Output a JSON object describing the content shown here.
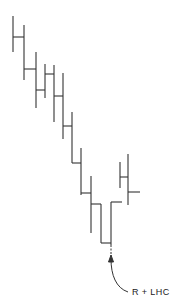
{
  "diagram": {
    "type": "cladogram-step-diagram",
    "stroke_color": "#333333",
    "background": "#ffffff",
    "annotation": {
      "label": "R + LHC",
      "arrow_tip": [
        111,
        256
      ],
      "curve_start": [
        128,
        292
      ]
    },
    "verticals": [
      {
        "x": 13,
        "y1": 16,
        "y2": 52
      },
      {
        "x": 24,
        "y1": 25,
        "y2": 80
      },
      {
        "x": 36,
        "y1": 52,
        "y2": 108
      },
      {
        "x": 45,
        "y1": 64,
        "y2": 98
      },
      {
        "x": 54,
        "y1": 65,
        "y2": 122
      },
      {
        "x": 63,
        "y1": 73,
        "y2": 139
      },
      {
        "x": 72,
        "y1": 112,
        "y2": 163
      },
      {
        "x": 81,
        "y1": 148,
        "y2": 195
      },
      {
        "x": 91,
        "y1": 176,
        "y2": 233
      },
      {
        "x": 101,
        "y1": 204,
        "y2": 243
      },
      {
        "x": 111,
        "y1": 202,
        "y2": 245
      },
      {
        "x": 120,
        "y1": 162,
        "y2": 188
      },
      {
        "x": 128,
        "y1": 154,
        "y2": 205
      }
    ],
    "horizontals": [
      {
        "y": 37,
        "x1": 13,
        "x2": 24
      },
      {
        "y": 69,
        "x1": 24,
        "x2": 36
      },
      {
        "y": 90,
        "x1": 36,
        "x2": 45
      },
      {
        "y": 74,
        "x1": 45,
        "x2": 54
      },
      {
        "y": 96,
        "x1": 54,
        "x2": 63
      },
      {
        "y": 126,
        "x1": 63,
        "x2": 72
      },
      {
        "y": 163,
        "x1": 72,
        "x2": 81
      },
      {
        "y": 193,
        "x1": 81,
        "x2": 91
      },
      {
        "y": 204,
        "x1": 91,
        "x2": 101
      },
      {
        "y": 243,
        "x1": 101,
        "x2": 111
      },
      {
        "y": 202,
        "x1": 111,
        "x2": 122
      },
      {
        "y": 177,
        "x1": 120,
        "x2": 128
      },
      {
        "y": 192,
        "x1": 128,
        "x2": 140
      }
    ]
  }
}
